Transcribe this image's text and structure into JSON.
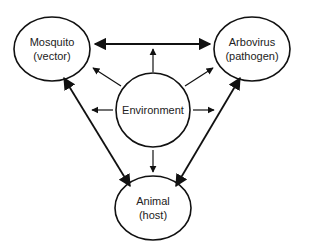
{
  "diagram": {
    "type": "relationship-diagram",
    "stroke_color": "#111111",
    "nodes": [
      {
        "id": "mosquito",
        "line1": "Mosquito",
        "line2": "(vector)",
        "cx": 52,
        "cy": 49,
        "rx": 38,
        "ry": 32
      },
      {
        "id": "arbovirus",
        "line1": "Arbovirus",
        "line2": "(pathogen)",
        "cx": 252,
        "cy": 49,
        "rx": 38,
        "ry": 32
      },
      {
        "id": "environment",
        "line1": "Environment",
        "line2": "",
        "cx": 153,
        "cy": 110,
        "rx": 37,
        "ry": 37
      },
      {
        "id": "animal",
        "line1": "Animal",
        "line2": "(host)",
        "cx": 153,
        "cy": 208,
        "rx": 38,
        "ry": 32
      }
    ],
    "edges": [
      {
        "from": "mosquito",
        "to": "arbovirus",
        "direction": "both"
      },
      {
        "from": "mosquito",
        "to": "animal",
        "direction": "both"
      },
      {
        "from": "arbovirus",
        "to": "animal",
        "direction": "both"
      },
      {
        "from": "environment",
        "to": "mosquito",
        "direction": "forward"
      },
      {
        "from": "environment",
        "to": "arbovirus",
        "direction": "forward"
      },
      {
        "from": "environment",
        "to": "animal",
        "direction": "forward"
      },
      {
        "from": "environment",
        "to": "mosquito-arbovirus-link",
        "direction": "forward"
      },
      {
        "from": "environment",
        "to": "mosquito-animal-link",
        "direction": "forward"
      },
      {
        "from": "environment",
        "to": "arbovirus-animal-link",
        "direction": "forward"
      }
    ]
  }
}
